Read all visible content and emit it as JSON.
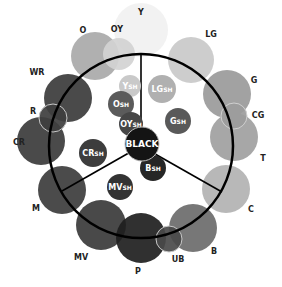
{
  "diagram": {
    "type": "color-wheel",
    "ring": {
      "cx": 141,
      "cy": 146,
      "r": 92,
      "stroke": "#000000"
    },
    "spokes": [
      {
        "x1": 141,
        "y1": 146,
        "x2": 141,
        "y2": 54
      },
      {
        "x1": 141,
        "y1": 146,
        "x2": 62,
        "y2": 191
      },
      {
        "x1": 141,
        "y1": 146,
        "x2": 222,
        "y2": 192
      }
    ],
    "outer_circles": [
      {
        "id": "Y",
        "label": "Y",
        "cx": 141,
        "cy": 30,
        "r": 27,
        "fill": "#f1f1f1",
        "lx": 141,
        "ly": 15
      },
      {
        "id": "O",
        "label": "O",
        "cx": 95,
        "cy": 56,
        "r": 24,
        "fill": "#a9a9a9",
        "lx": 83,
        "ly": 33
      },
      {
        "id": "OY",
        "label": "OY",
        "cx": 119,
        "cy": 54,
        "r": 16,
        "fill": "#d2d2d2",
        "lx": 117,
        "ly": 32
      },
      {
        "id": "LG",
        "label": "LG",
        "cx": 191,
        "cy": 60,
        "r": 23,
        "fill": "#c9c9c9",
        "lx": 211,
        "ly": 37
      },
      {
        "id": "WR",
        "label": "WR",
        "cx": 68,
        "cy": 98,
        "r": 24,
        "fill": "#3b3b3b",
        "lx": 37,
        "ly": 75
      },
      {
        "id": "CR",
        "label": "CR",
        "cx": 41,
        "cy": 141,
        "r": 24,
        "fill": "#3b3b3b",
        "lx": 19,
        "ly": 145
      },
      {
        "id": "R",
        "label": "R",
        "cx": 53,
        "cy": 118,
        "r": 14,
        "fill": "#3e3e3e",
        "lx": 33,
        "ly": 114,
        "outline": "#c8c8c8"
      },
      {
        "id": "G",
        "label": "G",
        "cx": 227,
        "cy": 94,
        "r": 24,
        "fill": "#9a9a9a",
        "lx": 254,
        "ly": 83
      },
      {
        "id": "T",
        "label": "T",
        "cx": 234,
        "cy": 137,
        "r": 24,
        "fill": "#a0a0a0",
        "lx": 263,
        "ly": 161
      },
      {
        "id": "CG",
        "label": "CG",
        "cx": 234,
        "cy": 116,
        "r": 13,
        "fill": "#9c9c9c",
        "lx": 258,
        "ly": 118,
        "outline": "#d0d0d0"
      },
      {
        "id": "C",
        "label": "C",
        "cx": 226,
        "cy": 189,
        "r": 24,
        "fill": "#b2b2b2",
        "lx": 251,
        "ly": 212
      },
      {
        "id": "M",
        "label": "M",
        "cx": 62,
        "cy": 190,
        "r": 24,
        "fill": "#3c3c3c",
        "lx": 36,
        "ly": 211
      },
      {
        "id": "MV",
        "label": "MV",
        "cx": 101,
        "cy": 225,
        "r": 25,
        "fill": "#3a3a3a",
        "lx": 81,
        "ly": 260
      },
      {
        "id": "B",
        "label": "B",
        "cx": 193,
        "cy": 228,
        "r": 24,
        "fill": "#6b6b6b",
        "lx": 214,
        "ly": 254
      },
      {
        "id": "P",
        "label": "P",
        "cx": 141,
        "cy": 238,
        "r": 25,
        "fill": "#1e1e1e",
        "lx": 138,
        "ly": 274
      },
      {
        "id": "UB",
        "label": "UB",
        "cx": 169,
        "cy": 239,
        "r": 13,
        "fill": "#4a4a4a",
        "lx": 178,
        "ly": 262,
        "outline": "#c8c8c8"
      }
    ],
    "inner_circles": [
      {
        "id": "YSH",
        "main": "Y",
        "sub": "SH",
        "cx": 130,
        "cy": 86,
        "r": 11,
        "fill": "#c9c9c9"
      },
      {
        "id": "OSH",
        "main": "O",
        "sub": "SH",
        "cx": 121,
        "cy": 104,
        "r": 13,
        "fill": "#5b5b5b"
      },
      {
        "id": "LGSH",
        "main": "LG",
        "sub": "SH",
        "cx": 162,
        "cy": 89,
        "r": 14,
        "fill": "#b0b0b0"
      },
      {
        "id": "OYSH",
        "main": "OY",
        "sub": "SH",
        "cx": 131,
        "cy": 124,
        "r": 12,
        "fill": "#464646"
      },
      {
        "id": "GSH",
        "main": "G",
        "sub": "SH",
        "cx": 178,
        "cy": 121,
        "r": 13,
        "fill": "#595959"
      },
      {
        "id": "CRSH",
        "main": "CR",
        "sub": "SH",
        "cx": 93,
        "cy": 153,
        "r": 14,
        "fill": "#3d3d3d"
      },
      {
        "id": "BSH",
        "main": "B",
        "sub": "SH",
        "cx": 153,
        "cy": 168,
        "r": 13,
        "fill": "#262626"
      },
      {
        "id": "MVSH",
        "main": "MV",
        "sub": "SH",
        "cx": 120,
        "cy": 187,
        "r": 13,
        "fill": "#333333"
      }
    ],
    "center": {
      "id": "BLACK",
      "label": "BLACK",
      "cx": 142,
      "cy": 144,
      "r": 17,
      "fill": "#141414",
      "outline": "#bdbdbd"
    }
  }
}
